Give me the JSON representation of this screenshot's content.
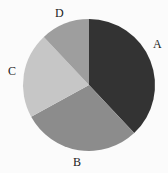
{
  "chart_data": {
    "type": "pie",
    "title": "",
    "categories": [
      "A",
      "B",
      "C",
      "D"
    ],
    "values": [
      38,
      29,
      21,
      12
    ],
    "colors": [
      "#333333",
      "#8c8c8c",
      "#c6c6c6",
      "#9e9e9e"
    ],
    "start_angle_deg": 90,
    "direction": "clockwise",
    "legend": "none",
    "labels_outside": true
  },
  "labels": {
    "A": "A",
    "B": "B",
    "C": "C",
    "D": "D"
  }
}
